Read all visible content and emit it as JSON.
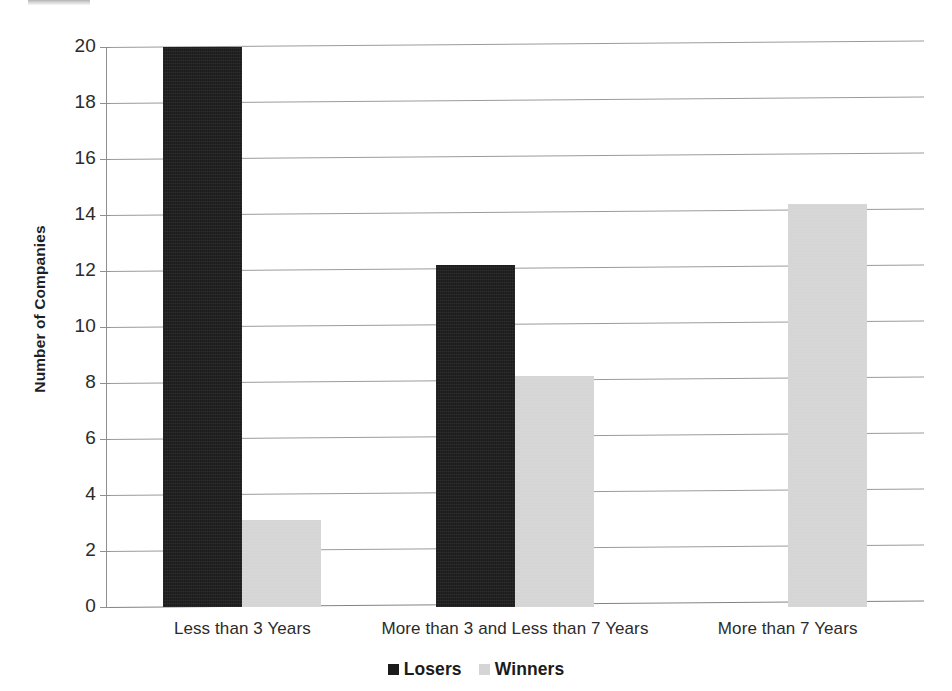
{
  "chart_data": {
    "type": "bar",
    "title": "",
    "subtitle": "",
    "xlabel": "",
    "ylabel": "Number of Companies",
    "categories": [
      "Less than 3 Years",
      "More than 3 and Less than 7 Years",
      "More than 7 Years"
    ],
    "series": [
      {
        "name": "Losers",
        "color": "#1b1b1b",
        "values": [
          20,
          12.2,
          0
        ]
      },
      {
        "name": "Winners",
        "color": "#d5d5d5",
        "values": [
          3.1,
          8.25,
          14.4
        ]
      }
    ],
    "ylim": [
      0,
      20
    ],
    "yticks": [
      0,
      2,
      4,
      6,
      8,
      10,
      12,
      14,
      16,
      18,
      20
    ],
    "ytick_labels": [
      "0",
      "2",
      "4",
      "6",
      "8",
      "10",
      "12",
      "14",
      "16",
      "18",
      "20"
    ],
    "grid": "horizontal",
    "legend_position": "bottom-center",
    "legend": [
      "Losers",
      "Winners"
    ]
  },
  "axis": {
    "y_title": "Number of Companies"
  },
  "legend": {
    "items": [
      {
        "label": "Losers"
      },
      {
        "label": "Winners"
      }
    ]
  }
}
